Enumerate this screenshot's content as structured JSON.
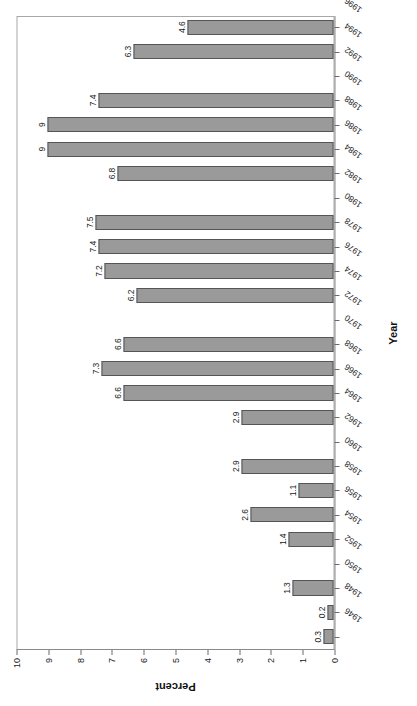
{
  "chart_data": {
    "type": "bar",
    "title": "",
    "xlabel": "Year",
    "ylabel": "Percent",
    "ylim": [
      0,
      10
    ],
    "ytick_labels": [
      "0",
      "1",
      "2",
      "3",
      "4",
      "5",
      "6",
      "7",
      "8",
      "9",
      "10"
    ],
    "yticks": [
      0,
      1,
      2,
      3,
      4,
      5,
      6,
      7,
      8,
      9,
      10
    ],
    "grid": false,
    "legend": "none",
    "orientation": "rotated-90-ccw",
    "bar_color": "#9a9a9a",
    "bar_edge_color": "#555555",
    "frame_color": "#a8a8a8",
    "axis_color": "#8a8a8a",
    "categories": [
      "1946",
      "1948",
      "1950",
      "1952",
      "1954",
      "1956",
      "1958",
      "1960",
      "1962",
      "1964",
      "1966",
      "1968",
      "1970",
      "1972",
      "1974",
      "1976",
      "1978",
      "1980",
      "1982",
      "1984",
      "1986",
      "1988",
      "1990",
      "1992",
      "1994",
      "1996"
    ],
    "values": [
      0.3,
      0.2,
      1.3,
      null,
      1.4,
      2.6,
      1.1,
      2.9,
      null,
      2.9,
      6.6,
      7.3,
      6.6,
      null,
      6.2,
      7.2,
      7.4,
      7.5,
      null,
      6.8,
      9,
      9,
      7.4,
      null,
      6.3,
      4.6
    ],
    "value_labels": [
      "0.3",
      "0.2",
      "1.3",
      "",
      "1.4",
      "2.6",
      "1.1",
      "2.9",
      "",
      "2.9",
      "6.6",
      "7.3",
      "6.6",
      "",
      "6.2",
      "7.2",
      "7.4",
      "7.5",
      "",
      "6.8",
      "9",
      "9",
      "7.4",
      "",
      "6.3",
      "4.6"
    ]
  }
}
